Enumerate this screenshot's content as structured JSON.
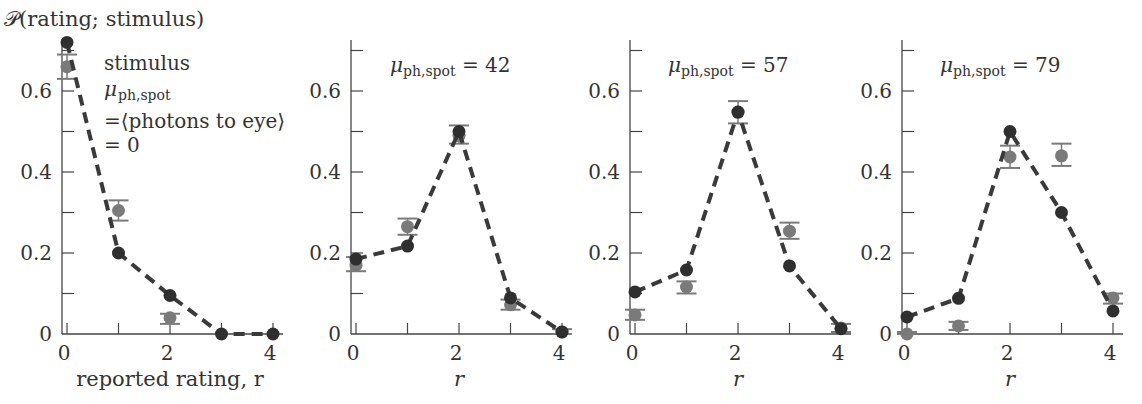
{
  "figure": {
    "ylabel": "𝒫(rating; stimulus)",
    "colors": {
      "model": "#2f2f2f",
      "data": "#7a7a7a",
      "axis": "#444444",
      "dash": "#3a3a3a"
    }
  },
  "chart_data": [
    {
      "type": "scatter",
      "title": "stimulus μ_ph,spot = ⟨photons to eye⟩ = 0",
      "annotation_lines": [
        "stimulus",
        "μ",
        "ph,spot",
        "=⟨photons to eye⟩",
        "=  0"
      ],
      "xlabel": "reported rating, r",
      "ylabel": "𝒫(rating; stimulus)",
      "x": [
        0,
        1,
        2,
        3,
        4
      ],
      "xticks": [
        "0",
        "2",
        "4"
      ],
      "yticks": [
        "0",
        "0.2",
        "0.4",
        "0.6"
      ],
      "ylim": [
        0,
        0.72
      ],
      "series": [
        {
          "name": "model",
          "style": "dark dots + dashed line",
          "values": [
            0.72,
            0.2,
            0.095,
            0.0,
            0.0
          ]
        },
        {
          "name": "data",
          "style": "gray dots with error bars",
          "values": [
            0.66,
            0.305,
            0.04,
            null,
            null
          ],
          "err_low": [
            0.63,
            0.28,
            0.025,
            null,
            null
          ],
          "err_high": [
            0.69,
            0.33,
            0.05,
            null,
            null
          ]
        }
      ]
    },
    {
      "type": "scatter",
      "title": "μ_ph,spot = 42",
      "annotation_main": "μ",
      "annotation_sub": "ph,spot",
      "annotation_value": "=  42",
      "xlabel": "r",
      "x": [
        0,
        1,
        2,
        3,
        4
      ],
      "xticks": [
        "0",
        "2",
        "4"
      ],
      "yticks": [
        "0",
        "0.2",
        "0.4",
        "0.6"
      ],
      "ylim": [
        0,
        0.72
      ],
      "series": [
        {
          "name": "model",
          "values": [
            0.185,
            0.217,
            0.5,
            0.089,
            0.005
          ]
        },
        {
          "name": "data",
          "values": [
            0.17,
            0.265,
            0.49,
            0.072,
            0.005
          ],
          "err_low": [
            0.155,
            0.245,
            0.47,
            0.06,
            0.0
          ],
          "err_high": [
            0.19,
            0.285,
            0.515,
            0.085,
            0.012
          ]
        }
      ]
    },
    {
      "type": "scatter",
      "title": "μ_ph,spot = 57",
      "annotation_main": "μ",
      "annotation_sub": "ph,spot",
      "annotation_value": "=  57",
      "xlabel": "r",
      "x": [
        0,
        1,
        2,
        3,
        4
      ],
      "xticks": [
        "0",
        "2",
        "4"
      ],
      "yticks": [
        "0",
        "0.2",
        "0.4",
        "0.6"
      ],
      "ylim": [
        0,
        0.72
      ],
      "series": [
        {
          "name": "model",
          "values": [
            0.104,
            0.158,
            0.548,
            0.168,
            0.013
          ]
        },
        {
          "name": "data",
          "values": [
            0.047,
            0.116,
            0.548,
            0.254,
            0.015
          ],
          "err_low": [
            0.035,
            0.1,
            0.52,
            0.235,
            0.005
          ],
          "err_high": [
            0.06,
            0.13,
            0.575,
            0.275,
            0.025
          ]
        }
      ]
    },
    {
      "type": "scatter",
      "title": "μ_ph,spot = 79",
      "annotation_main": "μ",
      "annotation_sub": "ph,spot",
      "annotation_value": "= 79",
      "xlabel": "r",
      "x": [
        0,
        1,
        2,
        3,
        4
      ],
      "xticks": [
        "0",
        "2",
        "4"
      ],
      "yticks": [
        "0",
        "0.2",
        "0.4",
        "0.6"
      ],
      "ylim": [
        0,
        0.72
      ],
      "series": [
        {
          "name": "model",
          "values": [
            0.042,
            0.088,
            0.5,
            0.3,
            0.057
          ]
        },
        {
          "name": "data",
          "values": [
            0.0,
            0.02,
            0.437,
            0.44,
            0.089
          ],
          "err_low": [
            0.0,
            0.01,
            0.41,
            0.415,
            0.075
          ],
          "err_high": [
            0.005,
            0.03,
            0.465,
            0.47,
            0.1
          ]
        }
      ]
    }
  ]
}
